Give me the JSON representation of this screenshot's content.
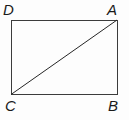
{
  "figure": {
    "kind": "geometry-diagram",
    "background_color": "#fdfdfd",
    "stroke_color": "#3c3c3c",
    "diagonal_color": "#262626",
    "label_color": "#1a1a1a",
    "stroke_width": 1,
    "canvas": {
      "width": 129,
      "height": 120
    },
    "rectangle": {
      "left": 11,
      "top": 20,
      "right": 117,
      "bottom": 94.5,
      "width": 106,
      "height": 74.5
    },
    "diagonal": {
      "from": "C",
      "to": "A",
      "x1": 11,
      "y1": 94.5,
      "x2": 117,
      "y2": 20
    },
    "vertices": [
      {
        "id": "D",
        "label": "D",
        "corner": "top-left",
        "x": 11,
        "y": 20
      },
      {
        "id": "A",
        "label": "A",
        "corner": "top-right",
        "x": 117,
        "y": 20
      },
      {
        "id": "C",
        "label": "C",
        "corner": "bottom-left",
        "x": 11,
        "y": 94.5
      },
      {
        "id": "B",
        "label": "B",
        "corner": "bottom-right",
        "x": 117,
        "y": 94.5
      }
    ]
  }
}
